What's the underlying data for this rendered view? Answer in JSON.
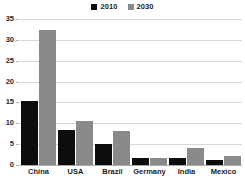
{
  "chart_data": {
    "type": "bar",
    "title": "",
    "subtitle": "",
    "xlabel": "",
    "ylabel": "",
    "categories": [
      "China",
      "USA",
      "Brazil",
      "Germany",
      "India",
      "Mexico"
    ],
    "series": [
      {
        "name": "2010",
        "color": "#0d0d0d",
        "values": [
          15.3,
          8.5,
          5.0,
          1.7,
          1.6,
          1.1
        ]
      },
      {
        "name": "2030",
        "color": "#8a8a8a",
        "values": [
          32.3,
          10.6,
          8.1,
          1.7,
          4.1,
          2.1
        ]
      }
    ],
    "ylim": [
      0,
      35
    ],
    "yticks": [
      0,
      5,
      10,
      15,
      20,
      25,
      30,
      35
    ],
    "ytick_labels": [
      "0",
      "5",
      "10",
      "15",
      "20",
      "25",
      "30",
      "35"
    ],
    "grid": true,
    "grid_axis": "y",
    "legend": {
      "position": "top-center",
      "entries": [
        {
          "label": "2010",
          "color": "#0d0d0d"
        },
        {
          "label": "2030",
          "color": "#8a8a8a"
        }
      ]
    },
    "colors": {
      "background": "#ffffff",
      "gridline": "#d8d8d8",
      "axis": "#a9a9a9",
      "text": "#1d1d1d"
    }
  }
}
